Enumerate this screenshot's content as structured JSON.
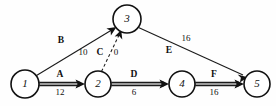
{
  "diagram": {
    "type": "activity-on-arrow network",
    "nodes": [
      {
        "id": "1",
        "label": "1",
        "cx": 25,
        "cy": 84,
        "r": 14
      },
      {
        "id": "2",
        "label": "2",
        "cx": 98,
        "cy": 84,
        "r": 13
      },
      {
        "id": "3",
        "label": "3",
        "cx": 127,
        "cy": 19,
        "r": 14
      },
      {
        "id": "4",
        "label": "4",
        "cx": 182,
        "cy": 84,
        "r": 13
      },
      {
        "id": "5",
        "label": "5",
        "cx": 257,
        "cy": 84,
        "r": 13
      }
    ],
    "edges": [
      {
        "id": "edge-a",
        "activity": "A",
        "duration": "12",
        "from": "1",
        "to": "2",
        "style": "bold-double",
        "name_x": 60,
        "name_y": 75,
        "duration_x": 60,
        "duration_y": 93
      },
      {
        "id": "edge-b",
        "activity": "B",
        "duration": "10",
        "from": "1",
        "to": "3",
        "style": "thin",
        "name_x": 61,
        "name_y": 41,
        "duration_x": 83,
        "duration_y": 53
      },
      {
        "id": "edge-c",
        "activity": "C",
        "duration": "0",
        "from": "2",
        "to": "3",
        "style": "dashed",
        "name_x": 100,
        "name_y": 53,
        "duration_x": 116,
        "duration_y": 53,
        "separator": "/"
      },
      {
        "id": "edge-d",
        "activity": "D",
        "duration": "6",
        "from": "2",
        "to": "4",
        "style": "bold-double",
        "name_x": 134,
        "name_y": 75,
        "duration_x": 134,
        "duration_y": 93
      },
      {
        "id": "edge-e",
        "activity": "E",
        "duration": "16",
        "from": "3",
        "to": "5",
        "style": "thin",
        "name_x": 169,
        "name_y": 51,
        "duration_x": 186,
        "duration_y": 39
      },
      {
        "id": "edge-f",
        "activity": "F",
        "duration": "16",
        "from": "4",
        "to": "5",
        "style": "bold-double",
        "name_x": 214,
        "name_y": 75,
        "duration_x": 214,
        "duration_y": 93
      }
    ],
    "colors": {
      "stroke": "#111111",
      "bold_edge_fill": "#9a9a9a",
      "background": "#fefefe"
    }
  }
}
